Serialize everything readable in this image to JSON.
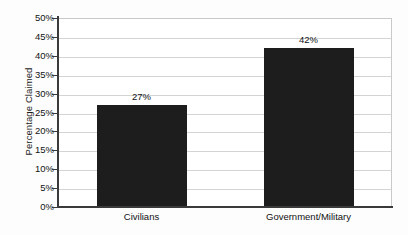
{
  "chart_data": {
    "type": "bar",
    "title": "",
    "xlabel": "",
    "ylabel": "Percentage Claimed",
    "categories": [
      "Civilians",
      "Government/Military"
    ],
    "values": [
      27,
      42
    ],
    "value_labels": [
      "27%",
      "42%"
    ],
    "ylim": [
      0,
      50
    ],
    "ytick_values": [
      0,
      5,
      10,
      15,
      20,
      25,
      30,
      35,
      40,
      45,
      50
    ],
    "ytick_labels": [
      "0%",
      "5%",
      "10%",
      "15%",
      "20%",
      "25%",
      "30%",
      "35%",
      "40%",
      "45%",
      "50%"
    ],
    "grid": true,
    "legend": "none",
    "bar_color": "#1d1d1d",
    "gridline_color": "#d4d4d4",
    "axis_color": "#3a3a3a",
    "background_color": "#ffffff"
  }
}
